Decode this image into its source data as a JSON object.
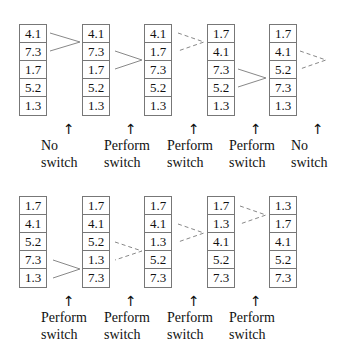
{
  "rows": [
    {
      "arrays": [
        {
          "values": [
            "4.1",
            "7.3",
            "1.7",
            "5.2",
            "1.3"
          ]
        },
        {
          "values": [
            "4.1",
            "7.3",
            "1.7",
            "5.2",
            "1.3"
          ]
        },
        {
          "values": [
            "4.1",
            "1.7",
            "7.3",
            "5.2",
            "1.3"
          ]
        },
        {
          "values": [
            "1.7",
            "4.1",
            "7.3",
            "5.2",
            "1.3"
          ]
        },
        {
          "values": [
            "1.7",
            "4.1",
            "5.2",
            "7.3",
            "1.3"
          ]
        }
      ],
      "steps": [
        {
          "line1": "No",
          "line2": "switch"
        },
        {
          "line1": "Perform",
          "line2": "switch"
        },
        {
          "line1": "Perform",
          "line2": "switch"
        },
        {
          "line1": "Perform",
          "line2": "switch"
        },
        {
          "line1": "No",
          "line2": "switch"
        }
      ]
    },
    {
      "arrays": [
        {
          "values": [
            "1.7",
            "4.1",
            "5.2",
            "7.3",
            "1.3"
          ]
        },
        {
          "values": [
            "1.7",
            "4.1",
            "5.2",
            "1.3",
            "7.3"
          ]
        },
        {
          "values": [
            "1.7",
            "4.1",
            "1.3",
            "5.2",
            "7.3"
          ]
        },
        {
          "values": [
            "1.7",
            "1.3",
            "4.1",
            "5.2",
            "7.3"
          ]
        },
        {
          "values": [
            "1.3",
            "1.7",
            "4.1",
            "5.2",
            "7.3"
          ]
        }
      ],
      "steps": [
        {
          "line1": "Perform",
          "line2": "switch"
        },
        {
          "line1": "Perform",
          "line2": "switch"
        },
        {
          "line1": "Perform",
          "line2": "switch"
        },
        {
          "line1": "Perform",
          "line2": "switch"
        }
      ]
    }
  ],
  "arrow_glyph": "↑"
}
